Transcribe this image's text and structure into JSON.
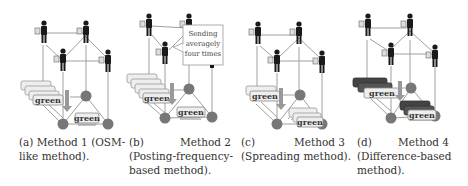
{
  "figure": {
    "colors": {
      "person": "#1a1a1a",
      "node": "#7a7a7a",
      "edge": "#999999",
      "box_light": "#eeeeee",
      "box_dark": "#444444",
      "box_border": "#888888",
      "arrow": "#888888"
    },
    "panels": [
      {
        "id": "a",
        "box_label": "green",
        "caption_lines": [
          "(a) Method 1 (OSM-",
          "like method)."
        ]
      },
      {
        "id": "b",
        "box_label": "green",
        "callout": [
          "Sending",
          "averagely",
          "four times"
        ],
        "caption_row": [
          "(b)",
          "Method 2"
        ],
        "caption_lines": [
          "(Posting-frequency-",
          "based method)."
        ]
      },
      {
        "id": "c",
        "box_label": "green",
        "caption_row": [
          "(c)",
          "Method 3"
        ],
        "caption_lines": [
          "(Spreading method)."
        ]
      },
      {
        "id": "d",
        "box_label": "green",
        "caption_row": [
          "(d)",
          "Method 4"
        ],
        "caption_lines": [
          "(Difference-based",
          "method)."
        ]
      }
    ]
  }
}
